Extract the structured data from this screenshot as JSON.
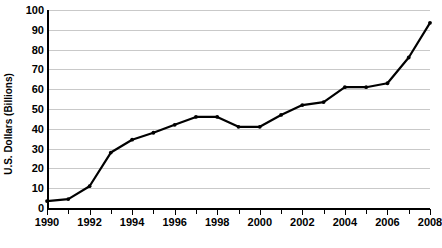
{
  "chart_data": {
    "type": "line",
    "title": "",
    "xlabel": "",
    "ylabel": "U.S. Dollars (Billions)",
    "xlim": [
      1990,
      2008
    ],
    "ylim": [
      0,
      100
    ],
    "grid": true,
    "legend": "none",
    "x": [
      1990,
      1991,
      1992,
      1993,
      1994,
      1995,
      1996,
      1997,
      1998,
      1999,
      2000,
      2001,
      2002,
      2003,
      2004,
      2005,
      2006,
      2007,
      2008
    ],
    "values": [
      3.5,
      4.5,
      11,
      28,
      34.5,
      38,
      42,
      46,
      46,
      41,
      41,
      47,
      52,
      53.5,
      61,
      61,
      63,
      76,
      93.5
    ],
    "series": [
      {
        "name": "U.S. Dollars (Billions)",
        "values": [
          3.5,
          4.5,
          11,
          28,
          34.5,
          38,
          42,
          46,
          46,
          41,
          41,
          47,
          52,
          53.5,
          61,
          61,
          63,
          76,
          93.5
        ],
        "color": "#000000"
      }
    ],
    "y_ticks": [
      0,
      10,
      20,
      30,
      40,
      50,
      60,
      70,
      80,
      90,
      100
    ],
    "y_tick_labels": [
      "0",
      "10",
      "20",
      "30",
      "40",
      "50",
      "60",
      "70",
      "80",
      "90",
      "100"
    ],
    "x_ticks": [
      1990,
      1991,
      1992,
      1993,
      1994,
      1995,
      1996,
      1997,
      1998,
      1999,
      2000,
      2001,
      2002,
      2003,
      2004,
      2005,
      2006,
      2007,
      2008
    ],
    "x_tick_labels": [
      "1990",
      "",
      "1992",
      "",
      "1994",
      "",
      "1996",
      "",
      "1998",
      "",
      "2000",
      "",
      "2002",
      "",
      "2004",
      "",
      "2006",
      "",
      "2008"
    ],
    "x_labeled": [
      "1990",
      "1992",
      "1994",
      "1996",
      "1998",
      "2000",
      "2002",
      "2004",
      "2006",
      "2008"
    ],
    "colors": {
      "line": "#000000",
      "grid": "#c9c9c9",
      "axis": "#000000",
      "background": "#ffffff",
      "text": "#000000"
    }
  }
}
